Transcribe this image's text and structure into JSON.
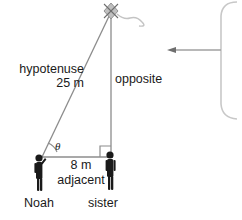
{
  "diagram": {
    "title_text": "",
    "background_color": "#ffffff",
    "line_color": "#8c8c8c",
    "text_color": "#1a1a1a",
    "figure_color": "#1a1a1a",
    "labels": {
      "hypotenuse": "hypotenuse\n25 m",
      "hypotenuse_word": "hypotenuse",
      "hypotenuse_value": "25 m",
      "opposite": "opposite",
      "adjacent_value": "8 m",
      "adjacent_word": "adjacent",
      "angle_symbol": "θ",
      "person_left": "Noah",
      "person_right": "sister"
    },
    "geometry": {
      "apex_x": 111,
      "apex_y": 12,
      "left_vertex_x": 42,
      "left_vertex_y": 157,
      "right_vertex_x": 111,
      "right_vertex_y": 157,
      "hypotenuse_length": "25 m",
      "adjacent_length": "8 m",
      "right_angle_marker": true,
      "angle_arc_marker": true
    },
    "kite": {
      "present": true,
      "shape": "diamond-star",
      "tail": "wavy"
    },
    "callout": {
      "present": true,
      "shape": "rounded-rectangle",
      "arrow_direction": "left",
      "arrow_label": ""
    }
  }
}
